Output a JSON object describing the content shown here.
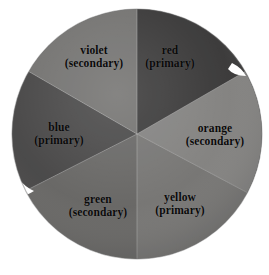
{
  "figure": {
    "kind": "color-wheel",
    "background_color": "#ffffff",
    "disc": {
      "center_x": 137,
      "center_y": 134,
      "radius": 125,
      "rim_color": "#6f6f6f",
      "seam_color": "#c8c8c8"
    }
  },
  "wheel": {
    "segments": [
      {
        "id": "red",
        "name": "red",
        "role": "(primary)",
        "fill": "#3b3a3a",
        "fill_light": "#4d4b4b",
        "start_angle": 0,
        "end_angle": 60,
        "label_x": 131,
        "label_y": 44
      },
      {
        "id": "orange",
        "name": "orange",
        "role": "(secondary)",
        "fill": "#8b8a88",
        "fill_light": "#9b9a98",
        "start_angle": 60,
        "end_angle": 118,
        "label_x": 166,
        "label_y": 122
      },
      {
        "id": "yellow",
        "name": "yellow",
        "role": "(primary)",
        "fill": "#7d7c7a",
        "fill_light": "#8d8c8a",
        "start_angle": 118,
        "end_angle": 180,
        "label_x": 137,
        "label_y": 191
      },
      {
        "id": "green",
        "name": "green",
        "role": "(secondary)",
        "fill": "#6d6c6a",
        "fill_light": "#7c7b79",
        "start_angle": 180,
        "end_angle": 243,
        "label_x": 52,
        "label_y": 193
      },
      {
        "id": "blue",
        "name": "blue",
        "role": "(primary)",
        "fill": "#4b4a4a",
        "fill_light": "#5a5959",
        "start_angle": 243,
        "end_angle": 300,
        "label_x": 16,
        "label_y": 121
      },
      {
        "id": "violet",
        "name": "violet",
        "role": "(secondary)",
        "fill": "#7a7977",
        "fill_light": "#8a8987",
        "start_angle": 300,
        "end_angle": 360,
        "label_x": 51,
        "label_y": 44
      }
    ]
  }
}
